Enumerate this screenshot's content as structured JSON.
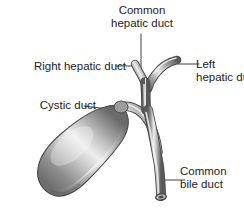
{
  "figure": {
    "background_color": "#ffffff",
    "ink_color": "#1c1c1c",
    "labels": {
      "common_hepatic_duct": {
        "line1": "Common",
        "line2": "hepatic duct"
      },
      "right_hepatic_duct": {
        "line1": "Right hepatic duct"
      },
      "left_hepatic_duct": {
        "line1": "Left",
        "line2": "hepatic duct"
      },
      "cystic_duct": {
        "line1": "Cystic duct"
      },
      "common_bile_duct": {
        "line1": "Common",
        "line2": "bile duct"
      }
    },
    "structures": [
      {
        "name": "common-hepatic-duct",
        "kind": "duct"
      },
      {
        "name": "right-hepatic-duct",
        "kind": "duct"
      },
      {
        "name": "left-hepatic-duct",
        "kind": "duct"
      },
      {
        "name": "cystic-duct",
        "kind": "duct"
      },
      {
        "name": "common-bile-duct",
        "kind": "duct"
      },
      {
        "name": "gallbladder",
        "kind": "organ"
      }
    ]
  }
}
